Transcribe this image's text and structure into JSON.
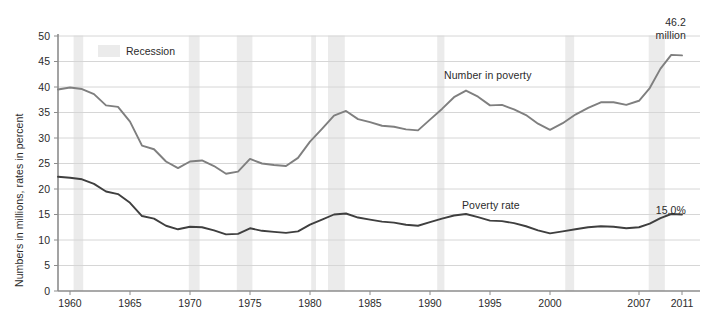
{
  "chart_data": {
    "type": "line",
    "title": "",
    "xlabel": "",
    "ylabel": "Numbers in millions, rates in percent",
    "ylim": [
      0,
      50
    ],
    "ytick_step": 5,
    "yticks": [
      "0",
      "5",
      "10",
      "15",
      "20",
      "25",
      "30",
      "35",
      "40",
      "45",
      "50"
    ],
    "xticks": [
      "1960",
      "1965",
      "1970",
      "1975",
      "1980",
      "1985",
      "1990",
      "1995",
      "2000",
      "2007",
      "2011"
    ],
    "xlim": [
      1959,
      2011
    ],
    "grid": "horizontal",
    "legend_position": "top-left-inside",
    "x": [
      1959,
      1960,
      1961,
      1962,
      1963,
      1964,
      1965,
      1966,
      1967,
      1968,
      1969,
      1970,
      1971,
      1972,
      1973,
      1974,
      1975,
      1976,
      1977,
      1978,
      1979,
      1980,
      1981,
      1982,
      1983,
      1984,
      1985,
      1986,
      1987,
      1988,
      1989,
      1990,
      1991,
      1992,
      1993,
      1994,
      1995,
      1996,
      1997,
      1998,
      1999,
      2000,
      2001,
      2002,
      2003,
      2004,
      2005,
      2006,
      2007,
      2008,
      2009,
      2010,
      2011
    ],
    "series": [
      {
        "name": "Number in poverty",
        "color": "#7f7f7f",
        "unit": "millions",
        "end_label": "46.2\nmillion",
        "values": [
          39.5,
          39.9,
          39.6,
          38.6,
          36.4,
          36.1,
          33.2,
          28.5,
          27.8,
          25.4,
          24.1,
          25.4,
          25.6,
          24.5,
          23.0,
          23.4,
          25.9,
          25.0,
          24.7,
          24.5,
          26.1,
          29.3,
          31.8,
          34.4,
          35.3,
          33.7,
          33.1,
          32.4,
          32.2,
          31.7,
          31.5,
          33.6,
          35.7,
          38.0,
          39.3,
          38.1,
          36.4,
          36.5,
          35.6,
          34.5,
          32.8,
          31.6,
          32.9,
          34.6,
          35.9,
          37.0,
          37.0,
          36.5,
          37.3,
          39.8,
          43.6,
          46.3,
          46.2
        ],
        "final_value": 46.2
      },
      {
        "name": "Poverty rate",
        "color": "#3f3f3f",
        "unit": "percent",
        "end_label": "15.0%",
        "values": [
          22.4,
          22.2,
          21.9,
          21.0,
          19.5,
          19.0,
          17.3,
          14.7,
          14.2,
          12.8,
          12.1,
          12.6,
          12.5,
          11.9,
          11.1,
          11.2,
          12.3,
          11.8,
          11.6,
          11.4,
          11.7,
          13.0,
          14.0,
          15.0,
          15.2,
          14.4,
          14.0,
          13.6,
          13.4,
          13.0,
          12.8,
          13.5,
          14.2,
          14.8,
          15.1,
          14.5,
          13.8,
          13.7,
          13.3,
          12.7,
          11.9,
          11.3,
          11.7,
          12.1,
          12.5,
          12.7,
          12.6,
          12.3,
          12.5,
          13.2,
          14.3,
          15.1,
          15.0
        ],
        "final_value": 15.0
      }
    ],
    "recessions": [
      {
        "start": 1960.3,
        "end": 1961.1
      },
      {
        "start": 1969.9,
        "end": 1970.8
      },
      {
        "start": 1973.9,
        "end": 1975.2
      },
      {
        "start": 1980.1,
        "end": 1980.5
      },
      {
        "start": 1981.5,
        "end": 1982.9
      },
      {
        "start": 1990.6,
        "end": 1991.2
      },
      {
        "start": 2001.2,
        "end": 2001.9
      },
      {
        "start": 2007.9,
        "end": 2009.4
      }
    ],
    "recession_color": "#ebebeb",
    "annotations": [
      {
        "name": "number-in-poverty-label",
        "text": "Number in poverty",
        "x": 444,
        "y": 69
      },
      {
        "name": "poverty-rate-label",
        "text": "Poverty rate",
        "x": 462,
        "y": 199
      },
      {
        "name": "number-end-label-line1",
        "text": "46.2",
        "x": 654,
        "y": 18
      },
      {
        "name": "number-end-label-line2",
        "text": "million",
        "x": 654,
        "y": 31
      },
      {
        "name": "rate-end-label",
        "text": "15.0%",
        "x": 654,
        "y": 206
      }
    ],
    "legend": {
      "label": "Recession",
      "swatch_color": "#ebebeb"
    }
  },
  "axis": {
    "y_title": "Numbers in millions, rates in percent"
  }
}
